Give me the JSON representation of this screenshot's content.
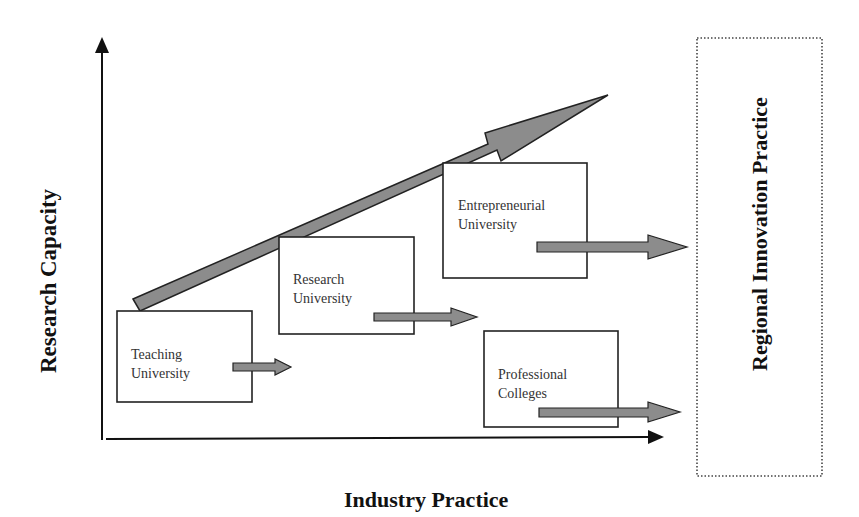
{
  "diagram": {
    "axes": {
      "y_label": "Research Capacity",
      "x_label": "Industry Practice"
    },
    "growth_arrow": {
      "from": [
        135,
        305
      ],
      "to": [
        608,
        95
      ],
      "meaning": "increasing research capacity"
    },
    "boxes": [
      {
        "id": "teaching",
        "label": "Teaching\nUniversity"
      },
      {
        "id": "research",
        "label": "Research\nUniversity"
      },
      {
        "id": "entrepreneurial",
        "label": "Entrepreneurial\nUniversity"
      },
      {
        "id": "professional",
        "label": "Professional\nColleges"
      }
    ],
    "outcome_box": {
      "label": "Regional Innovation Practice",
      "border_style": "dotted"
    },
    "colors": {
      "arrow_fill": "#8c8c8c",
      "stroke": "#222222",
      "text": "#333333"
    }
  }
}
